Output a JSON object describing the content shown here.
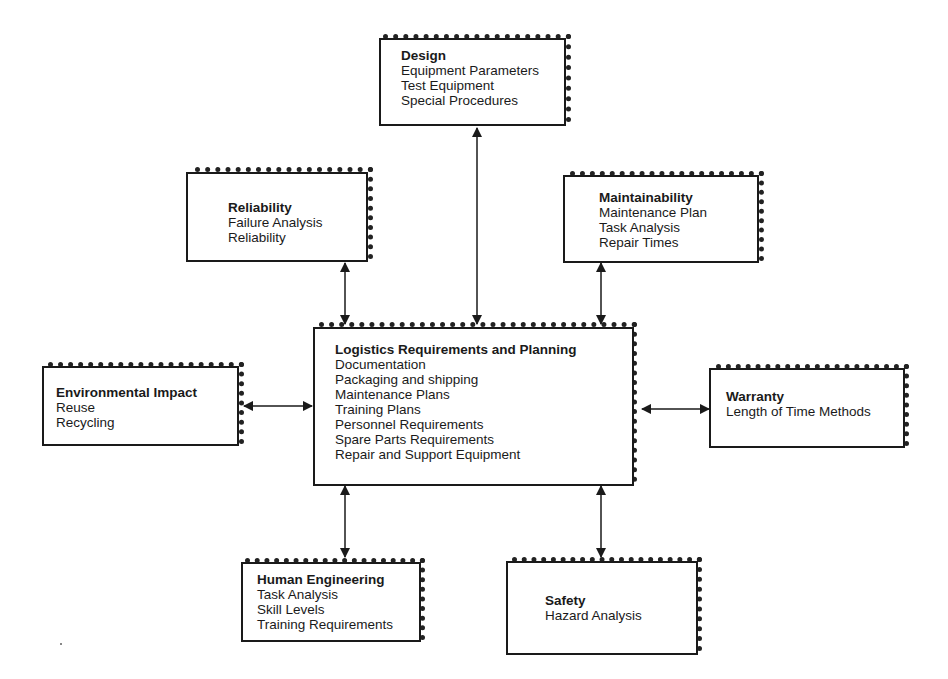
{
  "diagram": {
    "center": {
      "title": "Logistics Requirements and Planning",
      "items": [
        "Documentation",
        "Packaging and shipping",
        "Maintenance Plans",
        "Training Plans",
        "Personnel Requirements",
        "Spare Parts Requirements",
        "Repair and Support Equipment"
      ]
    },
    "design": {
      "title": "Design",
      "items": [
        "Equipment Parameters",
        "Test Equipment",
        "Special Procedures"
      ]
    },
    "reliability": {
      "title": "Reliability",
      "items": [
        "Failure Analysis",
        "Reliability"
      ]
    },
    "maintainability": {
      "title": "Maintainability",
      "items": [
        "Maintenance Plan",
        "Task Analysis",
        "Repair Times"
      ]
    },
    "environmental": {
      "title": "Environmental Impact",
      "items": [
        "Reuse",
        "Recycling"
      ]
    },
    "warranty": {
      "title": "Warranty",
      "items": [
        "Length of Time Methods"
      ]
    },
    "human_engineering": {
      "title": "Human Engineering",
      "items": [
        "Task Analysis",
        "Skill Levels",
        "Training Requirements"
      ]
    },
    "safety": {
      "title": "Safety",
      "items": [
        "Hazard Analysis"
      ]
    },
    "colors": {
      "line": "#1a1a1a",
      "background": "#ffffff"
    }
  }
}
